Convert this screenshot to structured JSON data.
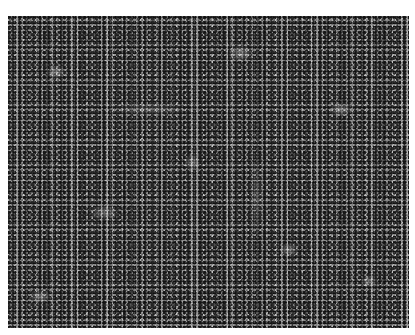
{
  "image": {
    "kind": "grayscale micrograph",
    "subject": "densely packed small round cells",
    "colors": {
      "page_background": "#ffffff",
      "ground": "#8c8c8c",
      "cell_dark": "#232323",
      "highlight": "#d8d8d8"
    }
  }
}
